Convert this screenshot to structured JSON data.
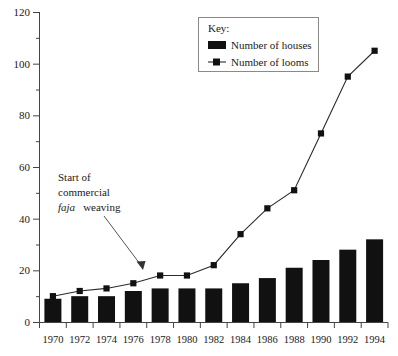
{
  "chart_data": {
    "type": "bar",
    "title": "",
    "xlabel": "",
    "ylabel": "",
    "ylim": [
      0,
      120
    ],
    "y_ticks": [
      0,
      20,
      40,
      60,
      80,
      100,
      120
    ],
    "y_minor_ticks": [
      10,
      30,
      50,
      70,
      90,
      110
    ],
    "grid": false,
    "legend_position": "top-right",
    "categories": [
      "1970",
      "1972",
      "1974",
      "1976",
      "1978",
      "1980",
      "1982",
      "1984",
      "1986",
      "1988",
      "1990",
      "1992",
      "1994"
    ],
    "series": [
      {
        "name": "Number of houses",
        "type": "bar",
        "color": "#111111",
        "values": [
          9,
          10,
          10,
          12,
          13,
          13,
          13,
          15,
          17,
          21,
          24,
          28,
          32
        ]
      },
      {
        "name": "Number of looms",
        "type": "line",
        "color": "#2b2b2b",
        "marker": "square",
        "values": [
          10,
          12,
          13,
          15,
          18,
          18,
          22,
          34,
          44,
          51,
          73,
          95,
          105
        ]
      }
    ],
    "annotations": [
      {
        "id": "start-of-commercial-faja-weaving",
        "lines": [
          "Start of",
          "commercial",
          "faja weaving"
        ],
        "italic_word": "faja",
        "points_to_category": "1978",
        "points_to_series": "Number of looms"
      }
    ]
  },
  "legend": {
    "title": "Key:",
    "entries": [
      {
        "label": "Number of houses",
        "symbol": "filled-rectangle"
      },
      {
        "label": "Number of looms",
        "symbol": "line-with-square-marker"
      }
    ]
  },
  "annotation": {
    "line1": "Start of",
    "line2": "commercial",
    "line3_italic": "faja",
    "line3_rest": "weaving"
  },
  "axes": {
    "y_tick_labels": [
      "0",
      "20",
      "40",
      "60",
      "80",
      "100",
      "120"
    ],
    "x_tick_labels": [
      "1970",
      "1972",
      "1974",
      "1976",
      "1978",
      "1980",
      "1982",
      "1984",
      "1986",
      "1988",
      "1990",
      "1992",
      "1994"
    ]
  }
}
